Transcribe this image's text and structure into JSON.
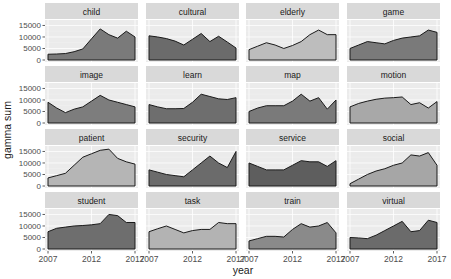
{
  "chart_data": {
    "type": "area",
    "title": "",
    "xlabel": "year",
    "ylabel": "gamma sum",
    "x_ticks": [
      "2007",
      "2012",
      "2017"
    ],
    "y_ticks": [
      "0",
      "5000",
      "10000",
      "15000"
    ],
    "xlim": [
      2007,
      2017
    ],
    "ylim": [
      0,
      16500
    ],
    "grid": true,
    "facets": "4x4, shared axes",
    "x": [
      2007,
      2008,
      2009,
      2010,
      2011,
      2012,
      2013,
      2014,
      2015,
      2016,
      2017
    ],
    "series": [
      {
        "name": "child",
        "fill": "#7a7a7a",
        "values": [
          2500,
          2600,
          2800,
          3600,
          4800,
          9200,
          13500,
          11000,
          9500,
          12500,
          10000
        ]
      },
      {
        "name": "cultural",
        "fill": "#6b6b6b",
        "values": [
          10500,
          10000,
          9300,
          8200,
          6500,
          9000,
          11500,
          8000,
          10300,
          7800,
          5200
        ]
      },
      {
        "name": "elderly",
        "fill": "#bdbdbd",
        "values": [
          4500,
          6000,
          7500,
          6500,
          5000,
          6300,
          8000,
          11000,
          13000,
          11000,
          11000
        ]
      },
      {
        "name": "game",
        "fill": "#7a7a7a",
        "values": [
          5000,
          6500,
          8000,
          7500,
          7000,
          8500,
          9500,
          10000,
          10500,
          13000,
          12000
        ]
      },
      {
        "name": "image",
        "fill": "#7d7d7d",
        "values": [
          9000,
          6500,
          4500,
          6000,
          7000,
          9500,
          12000,
          10000,
          9000,
          8000,
          7000
        ]
      },
      {
        "name": "learn",
        "fill": "#6e6e6e",
        "values": [
          8000,
          7000,
          6200,
          6200,
          6300,
          9000,
          12500,
          11500,
          10500,
          10200,
          11000
        ]
      },
      {
        "name": "map",
        "fill": "#7a7a7a",
        "values": [
          5000,
          6500,
          7500,
          7500,
          7500,
          9500,
          12500,
          9500,
          11000,
          6000,
          10000
        ]
      },
      {
        "name": "motion",
        "fill": "#a8a8a8",
        "values": [
          7000,
          8500,
          9500,
          10300,
          10800,
          11000,
          11300,
          8000,
          8800,
          6500,
          9300
        ]
      },
      {
        "name": "patient",
        "fill": "#b5b5b5",
        "values": [
          3500,
          4500,
          5500,
          9000,
          12500,
          14000,
          15500,
          16000,
          12000,
          10500,
          9500
        ]
      },
      {
        "name": "security",
        "fill": "#6b6b6b",
        "values": [
          7000,
          6000,
          5000,
          4500,
          4000,
          7000,
          10000,
          13000,
          10000,
          8000,
          15000
        ]
      },
      {
        "name": "service",
        "fill": "#5e5e5e",
        "values": [
          10000,
          8500,
          7000,
          7000,
          7000,
          9000,
          11000,
          10500,
          10500,
          8500,
          11000
        ]
      },
      {
        "name": "social",
        "fill": "#a6a6a6",
        "values": [
          1000,
          3000,
          5000,
          6500,
          7500,
          9000,
          10000,
          13500,
          13000,
          14500,
          9000
        ]
      },
      {
        "name": "student",
        "fill": "#6e6e6e",
        "values": [
          7500,
          9000,
          9500,
          10000,
          10200,
          10500,
          11000,
          15000,
          14500,
          11500,
          11500
        ]
      },
      {
        "name": "task",
        "fill": "#b3b3b3",
        "values": [
          7500,
          8800,
          10000,
          8500,
          7000,
          8000,
          8500,
          8500,
          11500,
          11000,
          11000
        ]
      },
      {
        "name": "train",
        "fill": "#8a8a8a",
        "values": [
          3500,
          4500,
          5500,
          5500,
          5200,
          8500,
          11000,
          9500,
          10000,
          11500,
          7000
        ]
      },
      {
        "name": "virtual",
        "fill": "#6b6b6b",
        "values": [
          5000,
          4800,
          4500,
          6000,
          8000,
          10000,
          12000,
          7500,
          8000,
          12500,
          11500
        ]
      }
    ]
  }
}
